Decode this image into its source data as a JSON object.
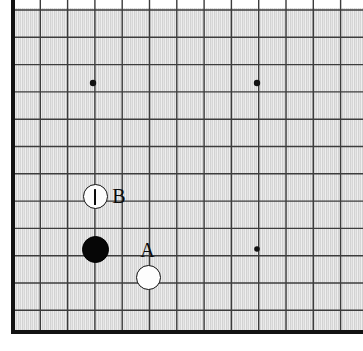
{
  "figure": {
    "kind": "go-board-diagram",
    "board_color": "#dadada",
    "line_color": "#3c3c3c",
    "border_color": "#121212",
    "stone_black_color": "#060606",
    "stone_white_color": "#fdfdfd",
    "label_color": "#0c0c0c",
    "width": 363,
    "height": 351
  },
  "grid": {
    "origin_x": 13,
    "origin_y": 10,
    "spacing": 27.3,
    "vertical_line_count": 13,
    "horizontal_line_count": 12,
    "left_border_x": 13,
    "bottom_border_y": 332,
    "border_thickness": 4,
    "line_thickness": 1.4
  },
  "star_points": [
    {
      "name": "star-point-upper-left",
      "x": 93,
      "y": 83,
      "radius": 3.2
    },
    {
      "name": "star-point-upper-right",
      "x": 257,
      "y": 83,
      "radius": 3.2
    },
    {
      "name": "star-point-lower-right",
      "x": 257,
      "y": 249,
      "radius": 2.8
    }
  ],
  "stones": [
    {
      "name": "white-stone-marked",
      "color": "white",
      "x": 95,
      "y": 196,
      "radius": 12.5,
      "mark": "vertical-bar",
      "mark_label": "I"
    },
    {
      "name": "black-stone",
      "color": "black",
      "x": 95,
      "y": 249,
      "radius": 13.5,
      "mark": "none",
      "mark_label": ""
    },
    {
      "name": "white-stone-a",
      "color": "white",
      "x": 148,
      "y": 277,
      "radius": 12.5,
      "mark": "none",
      "mark_label": ""
    }
  ],
  "labels": [
    {
      "name": "point-label-b",
      "text": "B",
      "x": 119,
      "y": 196,
      "font_size": 20
    },
    {
      "name": "point-label-a",
      "text": "A",
      "x": 147,
      "y": 250,
      "font_size": 20
    }
  ]
}
